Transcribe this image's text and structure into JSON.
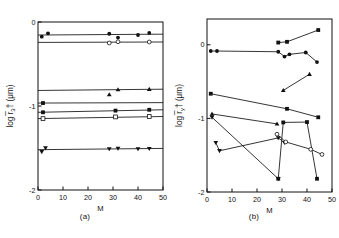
{
  "figure": {
    "background": "#ffffff",
    "ink": "#111111"
  },
  "panels": [
    {
      "id": "panel-a",
      "caption": "(a)",
      "axes": {
        "xlabel": "M",
        "ylabel_prefix": "log",
        "ylabel_symbol": "r",
        "ylabel_sub": "3",
        "ylabel_dagger": "†",
        "ylabel_units": "(μm)",
        "ylabel_full": "log r̅3† (μm)",
        "xlim": [
          0,
          50
        ],
        "ylim": [
          -2,
          0
        ],
        "xticks": [
          0,
          10,
          20,
          30,
          40,
          50
        ],
        "xticklabels": [
          "0",
          "10",
          "20",
          "30",
          "40",
          "50"
        ],
        "yticks": [
          0,
          -1,
          -2
        ],
        "yticklabels": [
          "0",
          "-1",
          "-2"
        ],
        "grid": false
      }
    },
    {
      "id": "panel-b",
      "caption": "(b)",
      "axes": {
        "xlabel": "M",
        "ylabel_prefix": "log",
        "ylabel_symbol": "r",
        "ylabel_sub": "y",
        "ylabel_dagger": "†",
        "ylabel_units": "(μm)",
        "ylabel_full": "log r̅y† (μm)",
        "xlim": [
          0,
          50
        ],
        "ylim": [
          -2,
          0.35
        ],
        "xticks": [
          0,
          10,
          20,
          30,
          40,
          50
        ],
        "xticklabels": [
          "0",
          "10",
          "20",
          "30",
          "40",
          "50"
        ],
        "yticks": [
          0,
          -1,
          -2
        ],
        "yticklabels": [
          "0",
          "-1",
          "-2"
        ],
        "grid": false
      }
    }
  ],
  "chart_data": [
    {
      "type": "scatter",
      "panel": "(a)",
      "title": "",
      "xlabel": "M",
      "ylabel": "log r̅3† (μm)",
      "xlim": [
        0,
        50
      ],
      "ylim": [
        -2,
        0
      ],
      "grid": false,
      "legend": "none",
      "series": [
        {
          "name": "series-1",
          "marker": "filled-circle",
          "fit_line": [
            [
              0,
              -0.155
            ],
            [
              50,
              -0.145
            ]
          ],
          "points": [
            {
              "x": 1.5,
              "y": -0.175
            },
            {
              "x": 4.0,
              "y": -0.135
            },
            {
              "x": 28.5,
              "y": -0.14
            },
            {
              "x": 32.0,
              "y": -0.185
            },
            {
              "x": 40.0,
              "y": -0.155
            },
            {
              "x": 44.5,
              "y": -0.13
            }
          ]
        },
        {
          "name": "series-2",
          "marker": "open-circle",
          "fit_line": [
            [
              0,
              -0.243
            ],
            [
              50,
              -0.238
            ]
          ],
          "points": [
            {
              "x": 28.5,
              "y": -0.25
            },
            {
              "x": 32.0,
              "y": -0.235
            },
            {
              "x": 44.5,
              "y": -0.238
            }
          ]
        },
        {
          "name": "series-3",
          "marker": "filled-triangle-up",
          "fit_line": [
            [
              0,
              -0.815
            ],
            [
              50,
              -0.8
            ]
          ],
          "points": [
            {
              "x": 28.5,
              "y": -0.865
            },
            {
              "x": 32.0,
              "y": -0.805
            },
            {
              "x": 44.5,
              "y": -0.8
            }
          ]
        },
        {
          "name": "series-4",
          "marker": "filled-square",
          "fit_line": [
            [
              0,
              -0.965
            ],
            [
              50,
              -0.96
            ]
          ],
          "points": [
            {
              "x": 2.0,
              "y": -0.965
            }
          ]
        },
        {
          "name": "series-5",
          "marker": "filled-square",
          "fit_line": [
            [
              0,
              -1.075
            ],
            [
              50,
              -1.045
            ]
          ],
          "points": [
            {
              "x": 2.0,
              "y": -1.075
            },
            {
              "x": 31.0,
              "y": -1.055
            },
            {
              "x": 44.5,
              "y": -1.045
            }
          ]
        },
        {
          "name": "series-6",
          "marker": "open-square",
          "fit_line": [
            [
              0,
              -1.15
            ],
            [
              50,
              -1.125
            ]
          ],
          "points": [
            {
              "x": 2.0,
              "y": -1.15
            },
            {
              "x": 31.0,
              "y": -1.13
            },
            {
              "x": 44.5,
              "y": -1.125
            }
          ]
        },
        {
          "name": "series-7",
          "marker": "filled-triangle-down",
          "fit_line": [
            [
              0,
              -1.52
            ],
            [
              50,
              -1.505
            ]
          ],
          "points": [
            {
              "x": 1.5,
              "y": -1.545
            },
            {
              "x": 3.0,
              "y": -1.5
            },
            {
              "x": 28.5,
              "y": -1.51
            },
            {
              "x": 32.0,
              "y": -1.505
            },
            {
              "x": 40.0,
              "y": -1.51
            },
            {
              "x": 44.5,
              "y": -1.508
            }
          ]
        }
      ]
    },
    {
      "type": "line",
      "panel": "(b)",
      "title": "",
      "xlabel": "M",
      "ylabel": "log r̅y† (μm)",
      "xlim": [
        0,
        50
      ],
      "ylim": [
        -2,
        0.35
      ],
      "grid": false,
      "legend": "none",
      "series": [
        {
          "name": "series-1",
          "marker": "filled-square",
          "connected": true,
          "points": [
            {
              "x": 28.5,
              "y": 0.03
            },
            {
              "x": 32.0,
              "y": 0.04
            },
            {
              "x": 44.5,
              "y": 0.2
            }
          ]
        },
        {
          "name": "series-2",
          "marker": "filled-circle",
          "connected": true,
          "points": [
            {
              "x": 1.5,
              "y": -0.085
            },
            {
              "x": 4.0,
              "y": -0.085
            },
            {
              "x": 28.5,
              "y": -0.095
            },
            {
              "x": 31.0,
              "y": -0.16
            },
            {
              "x": 33.0,
              "y": -0.13
            },
            {
              "x": 39.5,
              "y": -0.105
            },
            {
              "x": 44.0,
              "y": -0.235
            }
          ]
        },
        {
          "name": "series-3",
          "marker": "filled-triangle-up",
          "connected": true,
          "points": [
            {
              "x": 30.5,
              "y": -0.62
            },
            {
              "x": 41.0,
              "y": -0.4
            }
          ]
        },
        {
          "name": "series-4",
          "marker": "filled-square",
          "connected": true,
          "points": [
            {
              "x": 1.5,
              "y": -0.665
            },
            {
              "x": 32.0,
              "y": -0.87
            },
            {
              "x": 44.5,
              "y": -0.985
            }
          ]
        },
        {
          "name": "series-5",
          "marker": "filled-triangle-up",
          "connected": true,
          "points": [
            {
              "x": 2.0,
              "y": -0.94
            },
            {
              "x": 28.0,
              "y": -1.075
            }
          ]
        },
        {
          "name": "series-6",
          "marker": "filled-triangle-down",
          "connected": true,
          "points": [
            {
              "x": 2.0,
              "y": -0.985
            },
            {
              "x": 28.5,
              "y": -1.82
            }
          ]
        },
        {
          "name": "series-7",
          "marker": "filled-triangle-down",
          "connected": true,
          "points": [
            {
              "x": 3.5,
              "y": -1.33
            },
            {
              "x": 5.0,
              "y": -1.44
            },
            {
              "x": 28.5,
              "y": -1.265
            },
            {
              "x": 31.0,
              "y": -1.33
            }
          ]
        },
        {
          "name": "series-8",
          "marker": "filled-square",
          "connected": true,
          "points": [
            {
              "x": 28.5,
              "y": -1.82
            },
            {
              "x": 30.5,
              "y": -1.055
            },
            {
              "x": 40.0,
              "y": -1.05
            },
            {
              "x": 44.0,
              "y": -1.82
            }
          ]
        },
        {
          "name": "series-9",
          "marker": "open-circle",
          "connected": true,
          "points": [
            {
              "x": 28.0,
              "y": -1.215
            },
            {
              "x": 31.5,
              "y": -1.32
            },
            {
              "x": 41.5,
              "y": -1.42
            },
            {
              "x": 46.0,
              "y": -1.49
            }
          ]
        }
      ]
    }
  ]
}
